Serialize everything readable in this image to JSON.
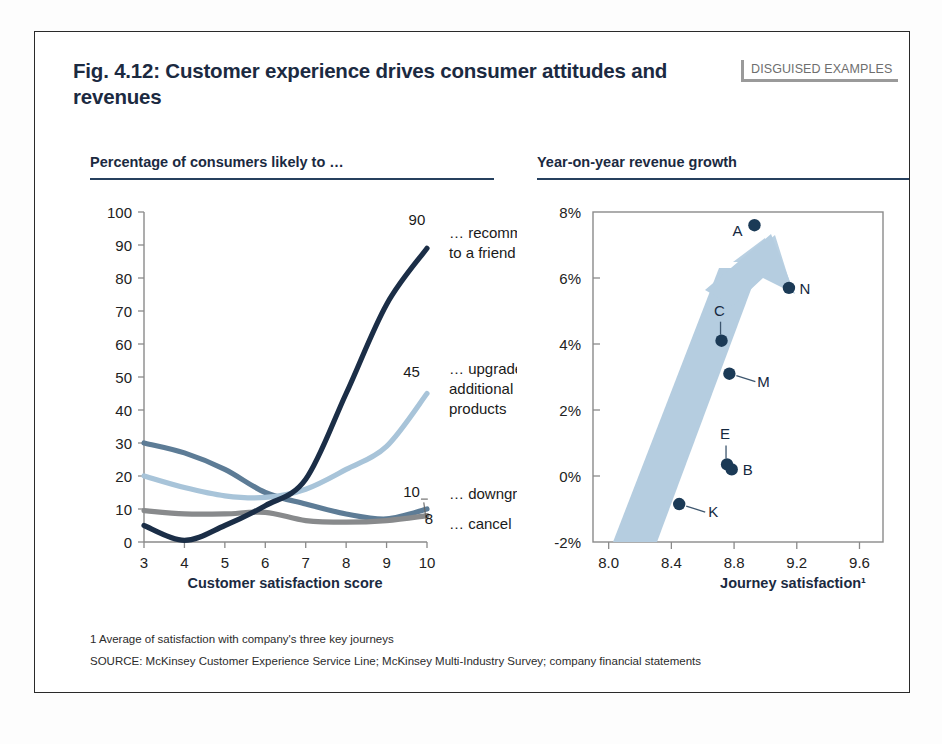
{
  "figure": {
    "title": "Fig. 4.12: Customer experience drives consumer attitudes and revenues",
    "badge": "DISGUISED EXAMPLES"
  },
  "footnotes": {
    "note": "1 Average of satisfaction with company's three key journeys",
    "source": "SOURCE: McKinsey Customer Experience Service Line; McKinsey Multi-Industry Survey; company financial statements"
  },
  "colors": {
    "title_navy": "#1b2a41",
    "rule_navy": "#26405e",
    "recommend": "#1b2e47",
    "upgrade": "#a8c4d9",
    "downgrade": "#5d7c96",
    "cancel": "#888a8c",
    "scatter_dot": "#1b3a56",
    "arrow": "#b5cde0",
    "badge_gray": "#9a9a9a"
  },
  "chart_data": [
    {
      "type": "line",
      "title": "Percentage of consumers likely to …",
      "xlabel": "Customer satisfaction score",
      "ylabel": "",
      "grid": false,
      "legend": "right-endpoint-labels",
      "categories": [
        3,
        4,
        5,
        6,
        7,
        8,
        9,
        10
      ],
      "xticks": [
        "3",
        "4",
        "5",
        "6",
        "7",
        "8",
        "9",
        "10"
      ],
      "yticks": [
        "0",
        "10",
        "20",
        "30",
        "40",
        "50",
        "60",
        "70",
        "80",
        "90",
        "100"
      ],
      "xlim": [
        3,
        10
      ],
      "ylim": [
        0,
        100
      ],
      "series": [
        {
          "name": "recommend-to-a-friend",
          "label": "… recommend to a friend",
          "end_value": "90",
          "color": "#1b2e47",
          "values": [
            5,
            0.5,
            5,
            11,
            19,
            45,
            72,
            89
          ]
        },
        {
          "name": "upgrade-or-buy-additional-products",
          "label": "… upgrade or buy additional products",
          "end_value": "45",
          "color": "#a8c4d9",
          "values": [
            20,
            16.5,
            14,
            13.5,
            16,
            22,
            29,
            45
          ]
        },
        {
          "name": "downgrade",
          "label": "… downgrade",
          "end_value": "10",
          "color": "#5d7c96",
          "values": [
            30,
            27,
            22,
            15,
            11.5,
            8.5,
            7,
            10
          ]
        },
        {
          "name": "cancel",
          "label": "… cancel",
          "end_value": "8",
          "color": "#888a8c",
          "values": [
            9.5,
            8.5,
            8.5,
            9,
            6.5,
            6,
            6.5,
            8
          ]
        }
      ]
    },
    {
      "type": "scatter",
      "title": "Year-on-year revenue growth",
      "xlabel": "Journey satisfaction¹",
      "ylabel": "",
      "grid": false,
      "legend": "point-labels",
      "xticks": [
        "8.0",
        "8.4",
        "8.8",
        "9.2",
        "9.6"
      ],
      "yticks": [
        "-2%",
        "0%",
        "2%",
        "4%",
        "6%",
        "8%"
      ],
      "xlim": [
        7.9,
        9.75
      ],
      "ylim": [
        -2,
        8
      ],
      "annotation": "upward-trend-arrow",
      "points": [
        {
          "label": "A",
          "x": 8.93,
          "y": 7.6,
          "label_pos": "left"
        },
        {
          "label": "N",
          "x": 9.15,
          "y": 5.7,
          "label_pos": "right"
        },
        {
          "label": "C",
          "x": 8.72,
          "y": 4.1,
          "label_pos": "leader-up"
        },
        {
          "label": "M",
          "x": 8.77,
          "y": 3.1,
          "label_pos": "leader-right"
        },
        {
          "label": "E",
          "x": 8.755,
          "y": 0.35,
          "label_pos": "leader-up"
        },
        {
          "label": "B",
          "x": 8.785,
          "y": 0.2,
          "label_pos": "right"
        },
        {
          "label": "K",
          "x": 8.45,
          "y": -0.85,
          "label_pos": "leader-right"
        }
      ]
    }
  ]
}
